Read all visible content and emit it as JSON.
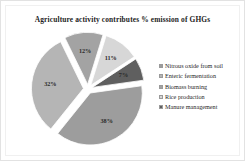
{
  "figure": {
    "background_color": "#ffffff",
    "border_color": "#e2e2e2"
  },
  "chart_data": {
    "type": "pie",
    "title": "Agriculture activity contributes % emission of GHGs",
    "xlabel": "",
    "ylabel": "",
    "exploded": true,
    "start_angle_deg": -8,
    "legend_position": "right",
    "grid": false,
    "categories": [
      "Nitrous oxide from soil",
      "Enteric fermentation",
      "Biomass burning",
      "Rice production",
      "Manure management"
    ],
    "values": [
      38,
      32,
      12,
      11,
      7
    ],
    "value_labels": [
      "38%",
      "32%",
      "12%",
      "11%",
      "7%"
    ],
    "colors": [
      "#9d9d9d",
      "#b5b5b5",
      "#a3a3a3",
      "#d7d7d7",
      "#5f5f5f"
    ],
    "label_colors": [
      "#2a2a2a",
      "#2a2a2a",
      "#2a2a2a",
      "#2a2a2a",
      "#f2f2f2"
    ],
    "total": 100
  },
  "legend": {
    "marker_shape": "square",
    "items": [
      {
        "label": "Nitrous oxide from soil",
        "color": "#9d9d9d"
      },
      {
        "label": "Enteric fermentation",
        "color": "#b5b5b5"
      },
      {
        "label": "Biomass burning",
        "color": "#a3a3a3"
      },
      {
        "label": "Rice production",
        "color": "#d7d7d7"
      },
      {
        "label": "Manure management",
        "color": "#5f5f5f"
      }
    ]
  }
}
